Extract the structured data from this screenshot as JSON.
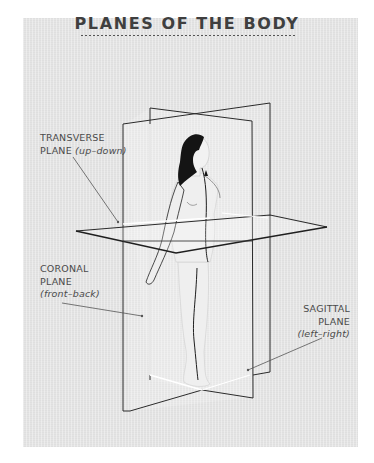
{
  "title": "PLANES OF THE BODY",
  "labels": {
    "transverse": {
      "line1": "TRANSVERSE",
      "line2_prefix": "PLANE ",
      "direction": "(up–down)"
    },
    "coronal": {
      "line1": "CORONAL",
      "line2": "PLANE",
      "direction": "(front–back)"
    },
    "sagittal": {
      "line1": "SAGITTAL",
      "line2": "PLANE",
      "direction": "(left–right)"
    }
  },
  "colors": {
    "background": "#e4e4e4",
    "outline": "#2b2b2b",
    "hair": "#141414",
    "body": "#efefef",
    "text": "#4a4a4a"
  }
}
